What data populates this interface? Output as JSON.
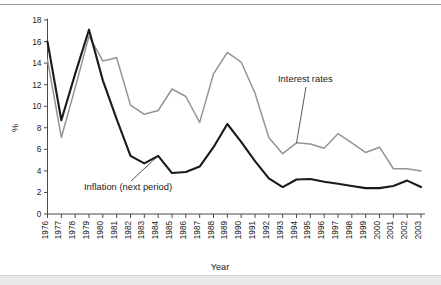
{
  "figure": {
    "caption_area": "",
    "background_color": "#ffffff"
  },
  "chart_data": {
    "type": "line",
    "title": "",
    "subtitle": "",
    "xlabel": "Year",
    "ylabel": "%",
    "xlim": [
      1976,
      2003
    ],
    "ylim": [
      0,
      18
    ],
    "ytick_step": 2,
    "grid": false,
    "legend_position": "inline-annotations",
    "categories": [
      "1976",
      "1977",
      "1978",
      "1979",
      "1980",
      "1981",
      "1982",
      "1983",
      "1984",
      "1985",
      "1986",
      "1987",
      "1988",
      "1989",
      "1990",
      "1991",
      "1992",
      "1993",
      "1994",
      "1995",
      "1996",
      "1997",
      "1998",
      "1999",
      "2000",
      "2001",
      "2002",
      "2003"
    ],
    "yticks": [
      "0",
      "2",
      "4",
      "6",
      "8",
      "10",
      "12",
      "14",
      "16",
      "18"
    ],
    "series": [
      {
        "name": "Inflation (next period)",
        "color": "#1a1a1a",
        "values": [
          16.0,
          8.7,
          13.0,
          17.1,
          12.4,
          8.8,
          5.4,
          4.7,
          5.4,
          3.8,
          3.9,
          4.4,
          6.2,
          8.35,
          6.7,
          4.9,
          3.3,
          2.5,
          3.2,
          3.25,
          3.0,
          2.8,
          2.6,
          2.4,
          2.4,
          2.6,
          3.1,
          2.5
        ]
      },
      {
        "name": "Interest rates",
        "color": "#949494",
        "values": [
          14.3,
          7.1,
          11.7,
          16.5,
          14.2,
          14.5,
          10.1,
          9.25,
          9.6,
          11.6,
          10.9,
          8.5,
          13.0,
          15.0,
          14.1,
          11.2,
          7.1,
          5.6,
          6.6,
          6.5,
          6.1,
          7.45,
          6.6,
          5.7,
          6.2,
          4.2,
          4.2,
          4.0
        ]
      }
    ],
    "annotations": [
      {
        "text": "Interest rates",
        "target_year": "1994",
        "target_value": 6.6
      },
      {
        "text": "Inflation (next period)",
        "target_year": "1984",
        "target_value": 5.4
      }
    ]
  }
}
